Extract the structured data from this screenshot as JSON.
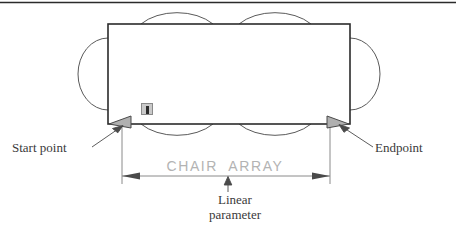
{
  "figure": {
    "type": "autocad-dynamic-block-diagram",
    "header_rule": {
      "visible": true,
      "color": "#2b2b2b"
    },
    "table": {
      "name": "conference-table-rectangle",
      "stroke": "#2b2b2b",
      "fill": "#ffffff"
    },
    "chairs": {
      "top_count": 2,
      "bottom_count": 2,
      "left_count": 1,
      "right_count": 1,
      "stroke": "#5a5a5a"
    },
    "grips": {
      "start": {
        "name": "start-point-grip",
        "shape": "arrow-triangle",
        "direction": "left",
        "fill": "#b0b0b0",
        "stroke": "#4a4a4a"
      },
      "end": {
        "name": "endpoint-grip",
        "shape": "arrow-triangle",
        "direction": "right",
        "fill": "#b0b0b0",
        "stroke": "#4a4a4a"
      }
    },
    "alert_icon": {
      "name": "linear-parameter-marker-icon",
      "fill": "#c9c9c9",
      "border": "#8a8a8a"
    }
  },
  "labels": {
    "start_point": "Start point",
    "endpoint": "Endpoint",
    "linear_parameter": "Linear\nparameter",
    "dimension_text": "CHAIR  ARRAY"
  },
  "dimension": {
    "name": "linear-parameter-dimension",
    "label": "CHAIR  ARRAY",
    "label_color": "#b3b3b3",
    "line_color": "#888888",
    "arrow_style": "filled-inward"
  },
  "leaders": {
    "start_point_leader": {
      "from": "Start point",
      "to": "start-point-grip"
    },
    "endpoint_leader": {
      "from": "Endpoint",
      "to": "endpoint-grip"
    },
    "linear_parameter_leader": {
      "from": "Linear parameter",
      "to": "dimension-line"
    }
  }
}
